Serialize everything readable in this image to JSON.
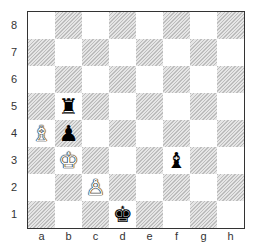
{
  "board": {
    "ranks": [
      "8",
      "7",
      "6",
      "5",
      "4",
      "3",
      "2",
      "1"
    ],
    "files": [
      "a",
      "b",
      "c",
      "d",
      "e",
      "f",
      "g",
      "h"
    ],
    "pieces": [
      {
        "square": "b5",
        "type": "rook",
        "color": "black",
        "glyph": "♜"
      },
      {
        "square": "a4",
        "type": "bishop",
        "color": "white",
        "glyph": "♗"
      },
      {
        "square": "b4",
        "type": "pawn",
        "color": "black",
        "glyph": "♟"
      },
      {
        "square": "b3",
        "type": "king",
        "color": "white",
        "glyph": "♔"
      },
      {
        "square": "f3",
        "type": "bishop",
        "color": "black",
        "glyph": "♝"
      },
      {
        "square": "c2",
        "type": "pawn",
        "color": "white",
        "glyph": "♙"
      },
      {
        "square": "d1",
        "type": "king",
        "color": "black",
        "glyph": "♚"
      }
    ]
  }
}
